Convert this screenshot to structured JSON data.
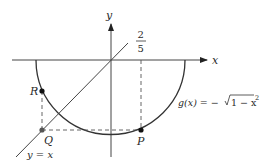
{
  "diagram": {
    "axes": {
      "x_label": "x",
      "y_label": "y"
    },
    "tick": {
      "numerator": "2",
      "denominator": "5"
    },
    "points": [
      {
        "name": "P",
        "label": "P"
      },
      {
        "name": "Q",
        "label": "Q"
      },
      {
        "name": "R",
        "label": "R"
      }
    ],
    "curve": {
      "label_prefix": "g(x) = −",
      "label_radical": "1 − x",
      "label_exponent": "2"
    },
    "line": {
      "label": "y = x"
    },
    "colors": {
      "stroke": "#333333",
      "dashed": "#444444",
      "point": "#111111",
      "point_q": "#555555"
    }
  }
}
